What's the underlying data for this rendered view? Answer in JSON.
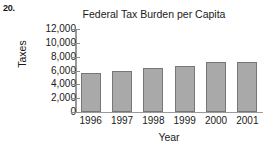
{
  "problem": {
    "number": "20."
  },
  "chart_data": {
    "type": "bar",
    "title": "Federal Tax Burden per Capita",
    "xlabel": "Year",
    "ylabel": "Taxes",
    "categories": [
      "1996",
      "1997",
      "1998",
      "1999",
      "2000",
      "2001"
    ],
    "values": [
      5600,
      5950,
      6300,
      6700,
      7300,
      7300
    ],
    "ylim": [
      0,
      12000
    ],
    "yticks": [
      0,
      2000,
      4000,
      6000,
      8000,
      10000,
      12000
    ],
    "ytick_labels": [
      "0",
      "2,000",
      "4,000",
      "6,000",
      "8,000",
      "10,000",
      "12,000"
    ],
    "grid": false,
    "legend": null,
    "bar_color": "#a9a9a9",
    "bar_border_color": "#777777",
    "axis_color": "#9a9a9a"
  }
}
